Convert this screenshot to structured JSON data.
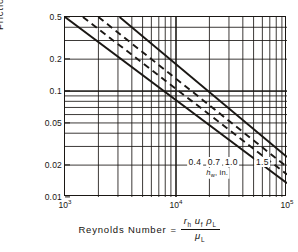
{
  "chart_data": {
    "type": "line",
    "title": "",
    "xlabel": "Reynolds Number = r_h u_f rho_L / mu_L",
    "ylabel": "Friction factor f",
    "xscale": "log",
    "yscale": "log",
    "xlim": [
      1000,
      100000
    ],
    "ylim": [
      0.01,
      0.5
    ],
    "grid": true,
    "legend_position": "inline-right-end",
    "xticks": [
      {
        "value": 1000,
        "label": "10",
        "exp": "3"
      },
      {
        "value": 10000,
        "label": "10",
        "exp": "4"
      },
      {
        "value": 100000,
        "label": "10",
        "exp": "5"
      }
    ],
    "yticks": [
      {
        "value": 0.5,
        "label": "0.5"
      },
      {
        "value": 0.2,
        "label": "0.2"
      },
      {
        "value": 0.1,
        "label": "0.1"
      },
      {
        "value": 0.05,
        "label": "0.05"
      },
      {
        "value": 0.02,
        "label": "0.02"
      },
      {
        "value": 0.01,
        "label": "0.01"
      }
    ],
    "series_units_label": "h",
    "series_units_sub": "w",
    "series_units_suffix": ", in.",
    "series": [
      {
        "name": "0.4",
        "label": "0.4",
        "style": "solid",
        "color": "#1a1714",
        "x": [
          1000,
          100000
        ],
        "y": [
          0.5,
          0.0135
        ]
      },
      {
        "name": "0.7",
        "label": "0.7",
        "style": "dashed",
        "color": "#1a1714",
        "x": [
          1450,
          100000
        ],
        "y": [
          0.5,
          0.0163
        ]
      },
      {
        "name": "1.0",
        "label": "1.0",
        "style": "dashed",
        "color": "#1a1714",
        "x": [
          2000,
          100000
        ],
        "y": [
          0.5,
          0.0192
        ]
      },
      {
        "name": "1.5",
        "label": "1.5",
        "style": "solid",
        "color": "#1a1714",
        "x": [
          3100,
          100000
        ],
        "y": [
          0.5,
          0.0239
        ]
      }
    ],
    "annotations": [
      {
        "text": "0.4",
        "x": 14800,
        "y": 0.0215
      },
      {
        "text": "0.7",
        "x": 22000,
        "y": 0.0215
      },
      {
        "text": "1.0",
        "x": 31500,
        "y": 0.0215
      },
      {
        "text": "1.5",
        "x": 60000,
        "y": 0.0215
      }
    ]
  },
  "axis": {
    "y_title_main": "Friction factor",
    "y_title_var": "f",
    "x_title_text": "Reynolds  Number",
    "x_title_eq": "=",
    "x_title_num_r": "r",
    "x_title_num_r_sub": "h",
    "x_title_num_u": "u",
    "x_title_num_u_sub": "f",
    "x_title_num_rho": "ρ",
    "x_title_num_rho_sub": "L",
    "x_title_den_mu": "μ",
    "x_title_den_mu_sub": "L"
  }
}
